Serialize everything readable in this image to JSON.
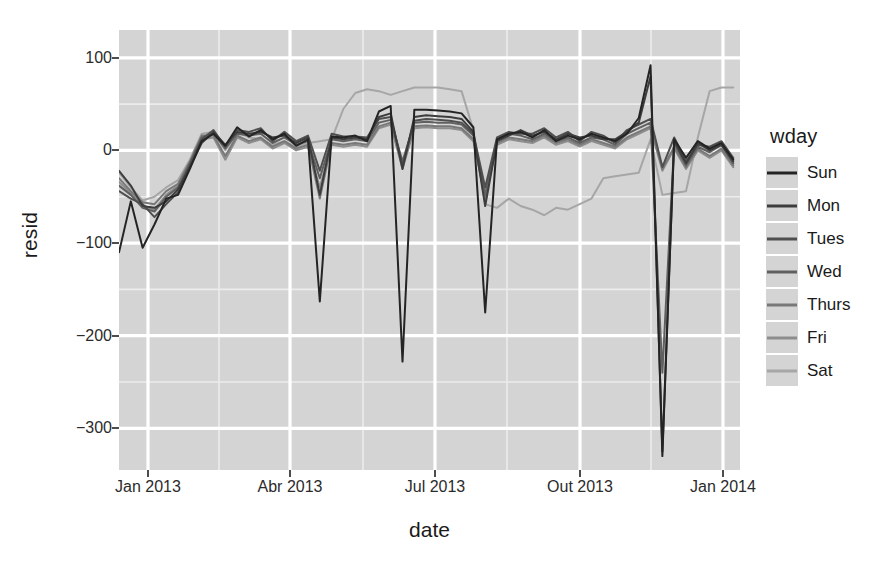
{
  "chart_data": {
    "type": "line",
    "title": "",
    "xlabel": "date",
    "ylabel": "resid",
    "xlim": [
      "2013-01-01",
      "2014-01-05"
    ],
    "ylim": [
      -345,
      130
    ],
    "grid": true,
    "legend_position": "right",
    "legend_title": "wday",
    "x_ticks": [
      {
        "label": "Jan 2013",
        "pos": 148
      },
      {
        "label": "Abr 2013",
        "pos": 290
      },
      {
        "label": "Jul 2013",
        "pos": 435
      },
      {
        "label": "Out 2013",
        "pos": 580
      },
      {
        "label": "Jan 2014",
        "pos": 723
      }
    ],
    "y_ticks": [
      {
        "label": "100",
        "value": 100
      },
      {
        "label": "0",
        "value": 0
      },
      {
        "label": "-100",
        "value": -100
      },
      {
        "label": "-200",
        "value": -200
      },
      {
        "label": "-300",
        "value": -300
      }
    ],
    "y_minor_gridlines": [
      50,
      -50,
      -150,
      -250
    ],
    "x_minor_gridlines": [
      219,
      363,
      507,
      651
    ],
    "colors": {
      "panel_background": "#d4d4d4",
      "gridline_major": "#ffffff",
      "gridline_minor": "#ececec",
      "axis_text": "#2b2b2b",
      "title_text": "#1a1a1a"
    },
    "series": [
      {
        "name": "Sun",
        "color": "#242424",
        "x": [
          0,
          7,
          14,
          21,
          28,
          35,
          42,
          49,
          56,
          63,
          70,
          77,
          84,
          91,
          98,
          105,
          112,
          119,
          126,
          133,
          140,
          147,
          154,
          161,
          168,
          175,
          182,
          189,
          196,
          203,
          210,
          217,
          224,
          231,
          238,
          245,
          252,
          259,
          266,
          273,
          280,
          287,
          294,
          301,
          308,
          315,
          322,
          329,
          336,
          343,
          350,
          357,
          364
        ],
        "values": [
          -110,
          -55,
          -105,
          -80,
          -52,
          -48,
          -20,
          10,
          18,
          5,
          25,
          15,
          22,
          12,
          18,
          5,
          12,
          -163,
          15,
          14,
          16,
          10,
          42,
          48,
          -228,
          44,
          44,
          43,
          42,
          40,
          25,
          -175,
          12,
          18,
          20,
          14,
          22,
          10,
          16,
          12,
          18,
          14,
          10,
          18,
          35,
          92,
          -330,
          12,
          -8,
          10,
          2,
          8,
          -10
        ]
      },
      {
        "name": "Mon",
        "color": "#3d3d3d",
        "x": [
          0,
          7,
          14,
          21,
          28,
          35,
          42,
          49,
          56,
          63,
          70,
          77,
          84,
          91,
          98,
          105,
          112,
          119,
          126,
          133,
          140,
          147,
          154,
          161,
          168,
          175,
          182,
          189,
          196,
          203,
          210,
          217,
          224,
          231,
          238,
          245,
          252,
          259,
          266,
          273,
          280,
          287,
          294,
          301,
          308,
          315,
          322,
          329,
          336,
          343,
          350,
          357,
          364
        ],
        "values": [
          -22,
          -38,
          -60,
          -62,
          -55,
          -42,
          -18,
          8,
          20,
          6,
          20,
          18,
          20,
          14,
          16,
          8,
          14,
          -48,
          14,
          12,
          14,
          12,
          36,
          40,
          -20,
          36,
          38,
          37,
          36,
          34,
          20,
          -60,
          10,
          16,
          22,
          16,
          20,
          12,
          18,
          14,
          16,
          12,
          12,
          20,
          30,
          80,
          -325,
          10,
          -14,
          8,
          0,
          6,
          -12
        ]
      },
      {
        "name": "Tues",
        "color": "#4f4f4f",
        "x": [
          0,
          7,
          14,
          21,
          28,
          35,
          42,
          49,
          56,
          63,
          70,
          77,
          84,
          91,
          98,
          105,
          112,
          119,
          126,
          133,
          140,
          147,
          154,
          161,
          168,
          175,
          182,
          189,
          196,
          203,
          210,
          217,
          224,
          231,
          238,
          245,
          252,
          259,
          266,
          273,
          280,
          287,
          294,
          301,
          308,
          315,
          322,
          329,
          336,
          343,
          350,
          357,
          364
        ],
        "values": [
          -44,
          -52,
          -58,
          -72,
          -58,
          -45,
          -16,
          12,
          22,
          4,
          22,
          20,
          24,
          10,
          20,
          10,
          16,
          -22,
          18,
          15,
          15,
          14,
          34,
          36,
          -16,
          32,
          34,
          33,
          32,
          30,
          18,
          -40,
          14,
          20,
          18,
          18,
          24,
          14,
          20,
          10,
          20,
          16,
          8,
          22,
          28,
          34,
          -18,
          14,
          -12,
          6,
          4,
          10,
          -8
        ]
      },
      {
        "name": "Wed",
        "color": "#606060",
        "x": [
          0,
          7,
          14,
          21,
          28,
          35,
          42,
          49,
          56,
          63,
          70,
          77,
          84,
          91,
          98,
          105,
          112,
          119,
          126,
          133,
          140,
          147,
          154,
          161,
          168,
          175,
          182,
          189,
          196,
          203,
          210,
          217,
          224,
          231,
          238,
          245,
          252,
          259,
          266,
          273,
          280,
          287,
          294,
          301,
          308,
          315,
          322,
          329,
          336,
          343,
          350,
          357,
          364
        ],
        "values": [
          -38,
          -48,
          -62,
          -66,
          -50,
          -40,
          -14,
          14,
          18,
          2,
          18,
          16,
          18,
          8,
          14,
          6,
          10,
          -30,
          12,
          10,
          12,
          10,
          30,
          33,
          -12,
          30,
          31,
          30,
          30,
          28,
          16,
          -48,
          12,
          18,
          16,
          12,
          18,
          10,
          14,
          8,
          14,
          12,
          6,
          18,
          24,
          30,
          -240,
          8,
          -16,
          4,
          -2,
          6,
          -14
        ]
      },
      {
        "name": "Thurs",
        "color": "#787878",
        "x": [
          0,
          7,
          14,
          21,
          28,
          35,
          42,
          49,
          56,
          63,
          70,
          77,
          84,
          91,
          98,
          105,
          112,
          119,
          126,
          133,
          140,
          147,
          154,
          161,
          168,
          175,
          182,
          189,
          196,
          203,
          210,
          217,
          224,
          231,
          238,
          245,
          252,
          259,
          266,
          273,
          280,
          287,
          294,
          301,
          308,
          315,
          322,
          329,
          336,
          343,
          350,
          357,
          364
        ],
        "values": [
          -30,
          -44,
          -56,
          -58,
          -44,
          -36,
          -12,
          16,
          16,
          -6,
          16,
          10,
          14,
          4,
          10,
          2,
          6,
          -52,
          8,
          6,
          8,
          6,
          26,
          30,
          -18,
          26,
          27,
          26,
          26,
          24,
          12,
          -52,
          8,
          14,
          12,
          10,
          16,
          8,
          12,
          6,
          12,
          8,
          4,
          14,
          20,
          26,
          -20,
          4,
          -18,
          2,
          -6,
          2,
          -16
        ]
      },
      {
        "name": "Fri",
        "color": "#8d8d8d",
        "x": [
          0,
          7,
          14,
          21,
          28,
          35,
          42,
          49,
          56,
          63,
          70,
          77,
          84,
          91,
          98,
          105,
          112,
          119,
          126,
          133,
          140,
          147,
          154,
          161,
          168,
          175,
          182,
          189,
          196,
          203,
          210,
          217,
          224,
          231,
          238,
          245,
          252,
          259,
          266,
          273,
          280,
          287,
          294,
          301,
          308,
          315,
          322,
          329,
          336,
          343,
          350,
          357,
          364
        ],
        "values": [
          -34,
          -46,
          -60,
          -64,
          -48,
          -38,
          -14,
          12,
          14,
          -10,
          14,
          8,
          12,
          2,
          8,
          0,
          4,
          -40,
          6,
          4,
          6,
          4,
          24,
          28,
          -20,
          24,
          25,
          24,
          24,
          22,
          10,
          -50,
          6,
          12,
          10,
          8,
          14,
          6,
          10,
          4,
          10,
          6,
          2,
          12,
          18,
          24,
          -22,
          2,
          -20,
          0,
          -8,
          0,
          -18
        ]
      },
      {
        "name": "Sat",
        "color": "#a6a6a6",
        "x": [
          0,
          7,
          14,
          21,
          28,
          35,
          42,
          49,
          56,
          63,
          70,
          77,
          84,
          91,
          98,
          105,
          112,
          119,
          126,
          133,
          140,
          147,
          154,
          161,
          168,
          175,
          182,
          189,
          196,
          203,
          210,
          217,
          224,
          231,
          238,
          245,
          252,
          259,
          266,
          273,
          280,
          287,
          294,
          301,
          308,
          315,
          322,
          329,
          336,
          343,
          350,
          357,
          364
        ],
        "values": [
          -24,
          -40,
          -54,
          -50,
          -40,
          -32,
          -10,
          18,
          20,
          0,
          20,
          14,
          12,
          6,
          10,
          4,
          8,
          10,
          12,
          45,
          62,
          66,
          64,
          60,
          64,
          68,
          68,
          68,
          66,
          64,
          22,
          -58,
          -62,
          -52,
          -60,
          -64,
          -70,
          -62,
          -64,
          -58,
          -52,
          -30,
          -28,
          -26,
          -24,
          12,
          -48,
          -46,
          -44,
          14,
          64,
          68,
          68
        ]
      }
    ],
    "annotations": [
      {
        "label": "Memorial Day dip",
        "value": -163
      },
      {
        "label": "July 4 dip",
        "value": -228
      },
      {
        "label": "Labor Day dip",
        "value": -175
      },
      {
        "label": "Thanksgiving spike",
        "value": 115
      },
      {
        "label": "Christmas dip",
        "value": -330
      }
    ]
  }
}
